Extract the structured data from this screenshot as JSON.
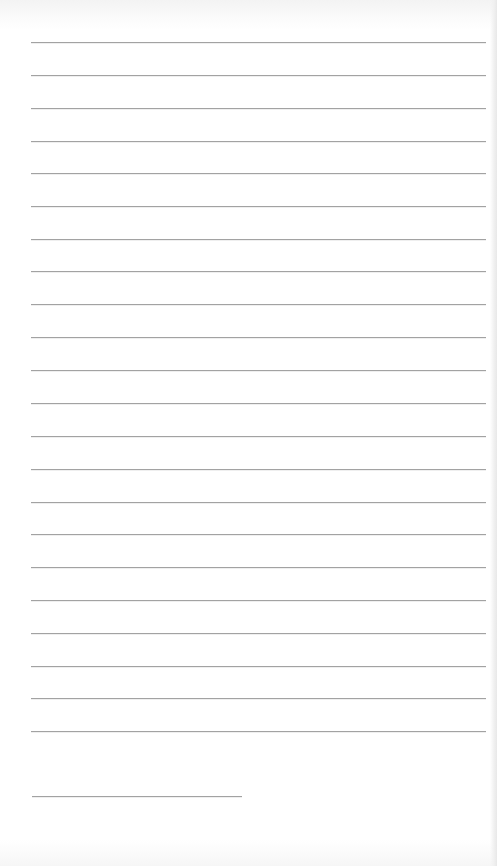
{
  "document": {
    "type": "lined-paper",
    "background_color": "#ffffff",
    "rule_color": "#a2a2a2",
    "full_rules": {
      "count": 22,
      "x_start": 31,
      "x_end": 486,
      "y_positions": [
        42,
        75,
        108,
        141,
        173,
        206,
        239,
        271,
        304,
        337,
        370,
        403,
        436,
        469,
        502,
        534,
        567,
        600,
        633,
        666,
        698,
        731
      ]
    },
    "short_rule": {
      "x_start": 32,
      "x_end": 242,
      "y": 796
    }
  }
}
